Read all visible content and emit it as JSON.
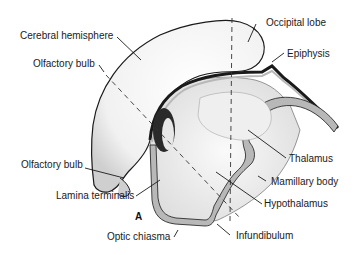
{
  "figure": {
    "panel_letter": "A"
  },
  "labels": {
    "cerebral_hemisphere": "Cerebral hemisphere",
    "olfactory_bulb_top": "Olfactory bulb",
    "olfactory_bulb_bottom": "Olfactory bulb",
    "lamina_terminalis": "Lamina terminalis",
    "optic_chiasma": "Optic chiasma",
    "occipital_lobe": "Occipital lobe",
    "epiphysis": "Epiphysis",
    "thalamus": "Thalamus",
    "mamillary_body": "Mamillary body",
    "hypothalamus": "Hypothalamus",
    "infundibulum": "Infundibulum"
  },
  "colors": {
    "outline": "#1a1a1a",
    "gray_tissue": "#b8b8b8",
    "stipple": "#e6e6e6",
    "background": "#ffffff"
  }
}
